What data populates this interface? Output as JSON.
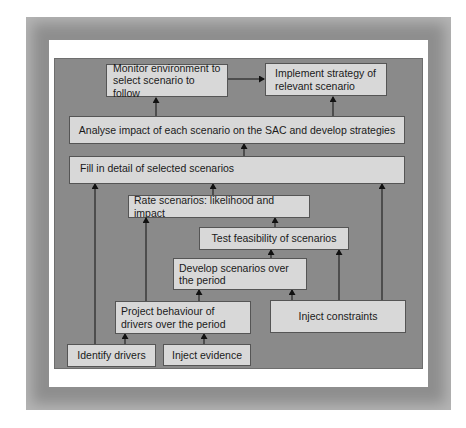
{
  "diagram": {
    "nodes": {
      "monitor": "Monitor environment to select scenario to follow",
      "implement": "Implement strategy of relevant scenario",
      "analyse": "Analyse impact of each scenario on the SAC and develop strategies",
      "fill": "Fill in detail of selected scenarios",
      "rate": "Rate scenarios: likelihood and impact",
      "test": "Test feasibility of scenarios",
      "develop": "Develop scenarios over the period",
      "project": "Project behaviour of drivers over the period",
      "constraints": "Inject constraints",
      "identify": "Identify drivers",
      "evidence": "Inject evidence"
    },
    "edges": [
      {
        "from": "monitor",
        "to": "implement"
      },
      {
        "from": "analyse",
        "to": "monitor"
      },
      {
        "from": "analyse",
        "to": "implement"
      },
      {
        "from": "fill",
        "to": "analyse"
      },
      {
        "from": "rate",
        "to": "fill"
      },
      {
        "from": "test",
        "to": "rate"
      },
      {
        "from": "develop",
        "to": "test"
      },
      {
        "from": "project",
        "to": "develop"
      },
      {
        "from": "constraints",
        "to": "develop"
      },
      {
        "from": "constraints",
        "to": "test"
      },
      {
        "from": "constraints",
        "to": "fill"
      },
      {
        "from": "identify",
        "to": "project"
      },
      {
        "from": "identify",
        "to": "fill"
      },
      {
        "from": "evidence",
        "to": "project"
      },
      {
        "from": "project",
        "to": "rate"
      }
    ],
    "colors": {
      "frame": "#8e8e8e",
      "panel": "#8a8a8a",
      "box": "#d8d8d8",
      "line": "#111111"
    }
  }
}
